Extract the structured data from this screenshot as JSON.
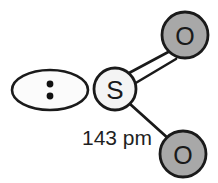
{
  "diagram": {
    "background_color": "#ffffff",
    "atoms": {
      "sulfur": {
        "symbol": "S",
        "cx": 115,
        "cy": 89,
        "r": 21,
        "fill_color": "#f4f4f4",
        "stroke_color": "#1a1a1a"
      },
      "oxygen_top": {
        "symbol": "O",
        "cx": 185,
        "cy": 35,
        "r": 23,
        "fill_color": "#a8a8a8",
        "stroke_color": "#1a1a1a"
      },
      "oxygen_bottom": {
        "symbol": "O",
        "cx": 183,
        "cy": 154,
        "r": 23,
        "fill_color": "#a8a8a8",
        "stroke_color": "#1a1a1a"
      }
    },
    "lone_pair": {
      "label": "lone pair",
      "cx": 50,
      "cy": 90,
      "rx": 38,
      "ry": 20,
      "fill_color": "#fbfbfb",
      "stroke_color": "#1a1a1a",
      "dot_color": "#111111",
      "dot_radius": 3.4,
      "dot_top_cy": 84,
      "dot_bottom_cy": 96
    },
    "bonds": {
      "double_bond": {
        "label": "S=O double bond",
        "order": 2,
        "stroke_color": "#1a1a1a",
        "stroke_width": 2.6
      },
      "single_bond": {
        "label": "S-O single bond",
        "order": 1,
        "stroke_color": "#1a1a1a",
        "stroke_width": 2.8
      }
    },
    "annotations": {
      "bond_length": {
        "text": "143 pm",
        "x": 82,
        "y": 145,
        "color": "#1f1f1f"
      }
    }
  }
}
